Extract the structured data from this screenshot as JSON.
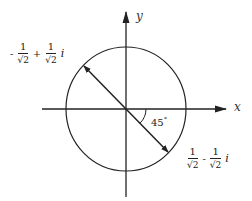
{
  "diagram": {
    "type": "complex-plane-unit-circle",
    "axes": {
      "x_label": "x",
      "y_label": "y"
    },
    "angle_label": {
      "value": "45",
      "unit": "°"
    },
    "points": [
      {
        "name": "upper-left",
        "sign1": "-",
        "real_num": "1",
        "real_den": "√2",
        "op": "+",
        "imag_num": "1",
        "imag_den": "√2",
        "imag_unit": "i"
      },
      {
        "name": "lower-right",
        "sign1": "",
        "real_num": "1",
        "real_den": "√2",
        "op": "-",
        "imag_num": "1",
        "imag_den": "√2",
        "imag_unit": "i"
      }
    ],
    "colors": {
      "stroke": "#222222",
      "background": "#ffffff"
    }
  }
}
